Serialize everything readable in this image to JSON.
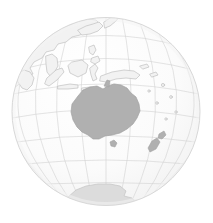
{
  "figure": {
    "type": "orthographic-globe-map",
    "width": 213,
    "height": 223
  },
  "projection": {
    "name": "orthographic",
    "center_lat": -25,
    "center_lon": 135,
    "globe_center_x": 106,
    "globe_center_y": 111.5,
    "globe_radius": 94
  },
  "colors": {
    "background": "#ffffff",
    "ocean": "#fbfbfb",
    "globe_outline": "#d8d8d8",
    "graticule": "#d2d2d2",
    "coastline": "#c0c0c0",
    "land_default": "#f2f2f2",
    "land_highlight": "#b0b0b0",
    "land_antarctica": "#dcdcdc",
    "shading": "#f4f4f4"
  },
  "graticule": {
    "visible": true,
    "meridian_step_deg": 15,
    "parallel_step_deg": 15,
    "line_width": 0.6
  },
  "features": [
    {
      "name": "australia",
      "label": "Australia",
      "style": "highlight"
    },
    {
      "name": "new-guinea",
      "label": "New Guinea",
      "style": "outline"
    },
    {
      "name": "new-zealand",
      "label": "New Zealand",
      "style": "highlight"
    },
    {
      "name": "tasmania",
      "label": "Tasmania",
      "style": "highlight"
    },
    {
      "name": "indonesia",
      "label": "Indonesia",
      "style": "outline"
    },
    {
      "name": "philippines",
      "label": "Philippines",
      "style": "outline"
    },
    {
      "name": "asia",
      "label": "Asia",
      "style": "outline"
    },
    {
      "name": "japan",
      "label": "Japan",
      "style": "outline"
    },
    {
      "name": "antarctica",
      "label": "Antarctica",
      "style": "polar"
    },
    {
      "name": "pacific-islands",
      "label": "Pacific Islands",
      "style": "outline"
    }
  ],
  "chart_data": {
    "type": "map",
    "projection": "orthographic",
    "center": {
      "lat": -25,
      "lon": 135
    },
    "graticule_interval_deg": 15,
    "highlighted_regions": [
      "Australia",
      "Tasmania",
      "New Zealand"
    ],
    "outlined_regions": [
      "Asia",
      "Japan",
      "Philippines",
      "Indonesia",
      "New Guinea",
      "Antarctica",
      "Pacific Islands"
    ],
    "legend": [],
    "annotations": []
  }
}
